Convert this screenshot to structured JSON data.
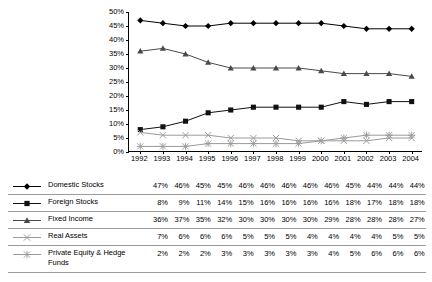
{
  "chart_data": {
    "type": "line",
    "title": "",
    "xlabel": "",
    "ylabel": "",
    "ylim": [
      0,
      50
    ],
    "ytick_labels": [
      "0%",
      "5%",
      "10%",
      "15%",
      "20%",
      "25%",
      "30%",
      "35%",
      "40%",
      "45%",
      "50%"
    ],
    "ytick_values": [
      0,
      5,
      10,
      15,
      20,
      25,
      30,
      35,
      40,
      45,
      50
    ],
    "grid": false,
    "legend_position": "below-as-table",
    "categories": [
      "1992",
      "1993",
      "1994",
      "1995",
      "1996",
      "1997",
      "1998",
      "1999",
      "2000",
      "2001",
      "2002",
      "2003",
      "2004"
    ],
    "series": [
      {
        "name": "Domestic Stocks",
        "marker": "diamond",
        "color": "#000000",
        "values": [
          47,
          46,
          45,
          45,
          46,
          46,
          46,
          46,
          46,
          45,
          44,
          44,
          44
        ],
        "labels": [
          "47%",
          "46%",
          "45%",
          "45%",
          "46%",
          "46%",
          "46%",
          "46%",
          "46%",
          "45%",
          "44%",
          "44%",
          "44%"
        ]
      },
      {
        "name": "Foreign Stocks",
        "marker": "square",
        "color": "#111111",
        "values": [
          8,
          9,
          11,
          14,
          15,
          16,
          16,
          16,
          16,
          18,
          17,
          18,
          18
        ],
        "labels": [
          "8%",
          "9%",
          "11%",
          "14%",
          "15%",
          "16%",
          "16%",
          "16%",
          "16%",
          "18%",
          "17%",
          "18%",
          "18%"
        ]
      },
      {
        "name": "Fixed Income",
        "marker": "triangle",
        "color": "#4a4a4a",
        "values": [
          36,
          37,
          35,
          32,
          30,
          30,
          30,
          30,
          29,
          28,
          28,
          28,
          27
        ],
        "labels": [
          "36%",
          "37%",
          "35%",
          "32%",
          "30%",
          "30%",
          "30%",
          "30%",
          "29%",
          "28%",
          "28%",
          "28%",
          "27%"
        ]
      },
      {
        "name": "Real Assets",
        "marker": "x",
        "color": "#9a9a9a",
        "values": [
          7,
          6,
          6,
          6,
          5,
          5,
          5,
          4,
          4,
          4,
          4,
          5,
          5
        ],
        "labels": [
          "7%",
          "6%",
          "6%",
          "6%",
          "5%",
          "5%",
          "5%",
          "4%",
          "4%",
          "4%",
          "4%",
          "5%",
          "5%"
        ]
      },
      {
        "name": "Private Equity & Hedge Funds",
        "marker": "asterisk",
        "color": "#9a9a9a",
        "values": [
          2,
          2,
          2,
          3,
          3,
          3,
          3,
          3,
          4,
          5,
          6,
          6,
          6
        ],
        "labels": [
          "2%",
          "2%",
          "2%",
          "3%",
          "3%",
          "3%",
          "3%",
          "3%",
          "4%",
          "5%",
          "6%",
          "6%",
          "6%"
        ]
      }
    ]
  }
}
